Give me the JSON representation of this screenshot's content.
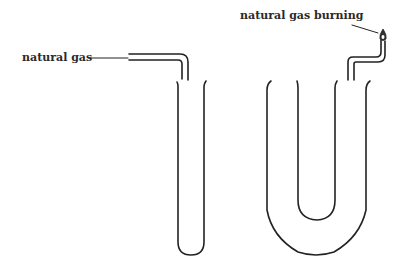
{
  "diagram": {
    "labels": {
      "inlet": "natural gas",
      "outlet": "natural gas burning"
    },
    "components": [
      {
        "id": "straight-tube",
        "description": "straight test tube with gas inlet pipe"
      },
      {
        "id": "u-tube",
        "description": "U-shaped tube with bent outlet pipe and flame"
      }
    ],
    "colors": {
      "line": "#222222",
      "background": "#ffffff"
    }
  }
}
